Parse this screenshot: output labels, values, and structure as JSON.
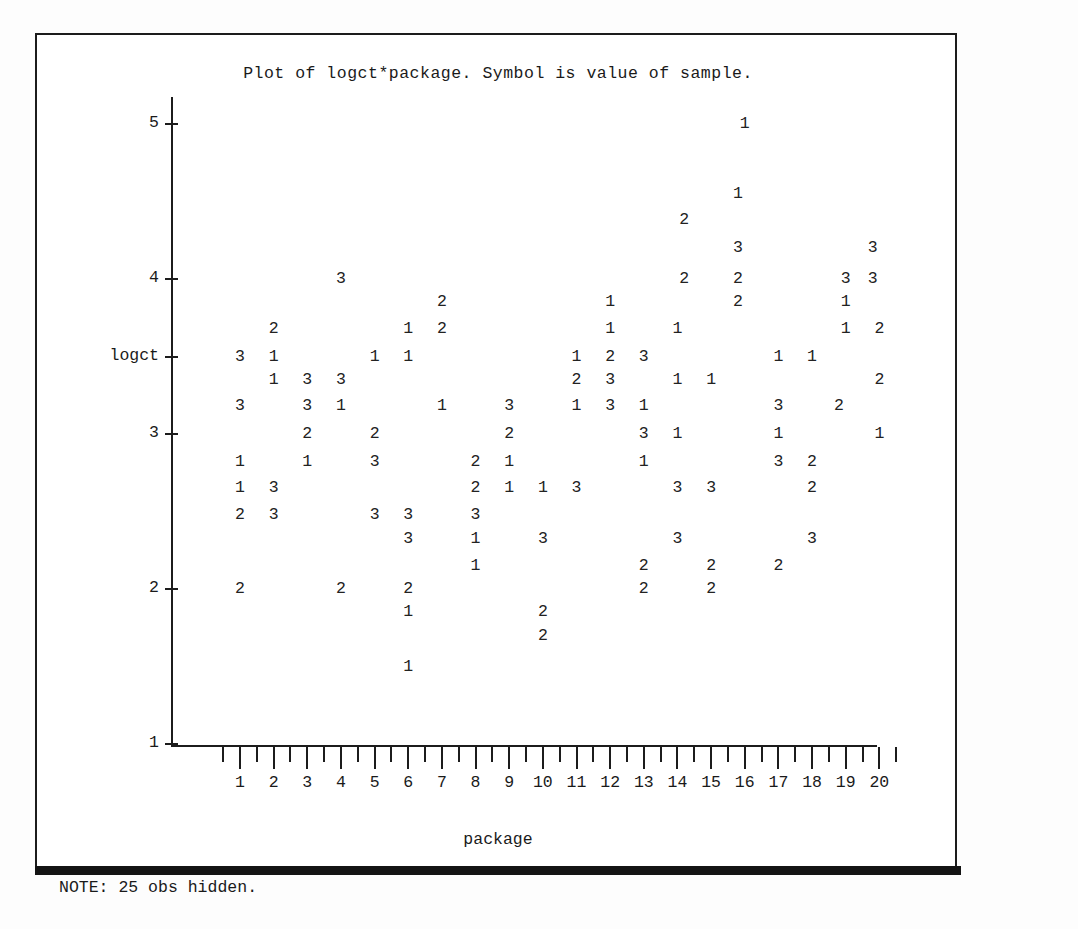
{
  "title": "Plot of logct*package. Symbol is value of sample.",
  "note": "NOTE: 25 obs hidden.",
  "axis": {
    "x_name": "package",
    "y_name": "logct"
  },
  "chart_data": {
    "type": "scatter",
    "title": "Plot of logct*package. Symbol is value of sample.",
    "xlabel": "package",
    "ylabel": "logct",
    "xlim": [
      0.5,
      20.5
    ],
    "ylim": [
      1,
      5.2
    ],
    "grid": false,
    "legend": null,
    "note": "NOTE: 25 obs hidden.",
    "symbol_meaning": "Symbol is value of sample (1, 2 or 3).",
    "x_ticks": [
      1,
      2,
      3,
      4,
      5,
      6,
      7,
      8,
      9,
      10,
      11,
      12,
      13,
      14,
      15,
      16,
      17,
      18,
      19,
      20
    ],
    "x_minor_ticks_per_interval": 1,
    "y_ticks": [
      5,
      4,
      3,
      2,
      1
    ],
    "y_axis_name_position": 3.5,
    "points": [
      {
        "package": 16.0,
        "logct": 5.0,
        "symbol": "1"
      },
      {
        "package": 15.8,
        "logct": 4.55,
        "symbol": "1"
      },
      {
        "package": 14.2,
        "logct": 4.38,
        "symbol": "2"
      },
      {
        "package": 15.8,
        "logct": 4.2,
        "symbol": "3"
      },
      {
        "package": 19.8,
        "logct": 4.2,
        "symbol": "3"
      },
      {
        "package": 4.0,
        "logct": 4.0,
        "symbol": "3"
      },
      {
        "package": 14.2,
        "logct": 4.0,
        "symbol": "2"
      },
      {
        "package": 15.8,
        "logct": 4.0,
        "symbol": "2"
      },
      {
        "package": 19.0,
        "logct": 4.0,
        "symbol": "3"
      },
      {
        "package": 19.8,
        "logct": 4.0,
        "symbol": "3"
      },
      {
        "package": 7.0,
        "logct": 3.85,
        "symbol": "2"
      },
      {
        "package": 12.0,
        "logct": 3.85,
        "symbol": "1"
      },
      {
        "package": 15.8,
        "logct": 3.85,
        "symbol": "2"
      },
      {
        "package": 19.0,
        "logct": 3.85,
        "symbol": "1"
      },
      {
        "package": 2.0,
        "logct": 3.68,
        "symbol": "2"
      },
      {
        "package": 6.0,
        "logct": 3.68,
        "symbol": "1"
      },
      {
        "package": 7.0,
        "logct": 3.68,
        "symbol": "2"
      },
      {
        "package": 12.0,
        "logct": 3.68,
        "symbol": "1"
      },
      {
        "package": 14.0,
        "logct": 3.68,
        "symbol": "1"
      },
      {
        "package": 19.0,
        "logct": 3.68,
        "symbol": "1"
      },
      {
        "package": 20.0,
        "logct": 3.68,
        "symbol": "2"
      },
      {
        "package": 1.0,
        "logct": 3.5,
        "symbol": "3"
      },
      {
        "package": 2.0,
        "logct": 3.5,
        "symbol": "1"
      },
      {
        "package": 5.0,
        "logct": 3.5,
        "symbol": "1"
      },
      {
        "package": 6.0,
        "logct": 3.5,
        "symbol": "1"
      },
      {
        "package": 11.0,
        "logct": 3.5,
        "symbol": "1"
      },
      {
        "package": 12.0,
        "logct": 3.5,
        "symbol": "2"
      },
      {
        "package": 13.0,
        "logct": 3.5,
        "symbol": "3"
      },
      {
        "package": 17.0,
        "logct": 3.5,
        "symbol": "1"
      },
      {
        "package": 18.0,
        "logct": 3.5,
        "symbol": "1"
      },
      {
        "package": 2.0,
        "logct": 3.35,
        "symbol": "1"
      },
      {
        "package": 3.0,
        "logct": 3.35,
        "symbol": "3"
      },
      {
        "package": 4.0,
        "logct": 3.35,
        "symbol": "3"
      },
      {
        "package": 11.0,
        "logct": 3.35,
        "symbol": "2"
      },
      {
        "package": 12.0,
        "logct": 3.35,
        "symbol": "3"
      },
      {
        "package": 14.0,
        "logct": 3.35,
        "symbol": "1"
      },
      {
        "package": 15.0,
        "logct": 3.35,
        "symbol": "1"
      },
      {
        "package": 20.0,
        "logct": 3.35,
        "symbol": "2"
      },
      {
        "package": 1.0,
        "logct": 3.18,
        "symbol": "3"
      },
      {
        "package": 3.0,
        "logct": 3.18,
        "symbol": "3"
      },
      {
        "package": 4.0,
        "logct": 3.18,
        "symbol": "1"
      },
      {
        "package": 7.0,
        "logct": 3.18,
        "symbol": "1"
      },
      {
        "package": 9.0,
        "logct": 3.18,
        "symbol": "3"
      },
      {
        "package": 11.0,
        "logct": 3.18,
        "symbol": "1"
      },
      {
        "package": 12.0,
        "logct": 3.18,
        "symbol": "3"
      },
      {
        "package": 13.0,
        "logct": 3.18,
        "symbol": "1"
      },
      {
        "package": 17.0,
        "logct": 3.18,
        "symbol": "3"
      },
      {
        "package": 18.8,
        "logct": 3.18,
        "symbol": "2"
      },
      {
        "package": 3.0,
        "logct": 3.0,
        "symbol": "2"
      },
      {
        "package": 5.0,
        "logct": 3.0,
        "symbol": "2"
      },
      {
        "package": 9.0,
        "logct": 3.0,
        "symbol": "2"
      },
      {
        "package": 13.0,
        "logct": 3.0,
        "symbol": "3"
      },
      {
        "package": 14.0,
        "logct": 3.0,
        "symbol": "1"
      },
      {
        "package": 17.0,
        "logct": 3.0,
        "symbol": "1"
      },
      {
        "package": 20.0,
        "logct": 3.0,
        "symbol": "1"
      },
      {
        "package": 1.0,
        "logct": 2.82,
        "symbol": "1"
      },
      {
        "package": 3.0,
        "logct": 2.82,
        "symbol": "1"
      },
      {
        "package": 5.0,
        "logct": 2.82,
        "symbol": "3"
      },
      {
        "package": 8.0,
        "logct": 2.82,
        "symbol": "2"
      },
      {
        "package": 9.0,
        "logct": 2.82,
        "symbol": "1"
      },
      {
        "package": 13.0,
        "logct": 2.82,
        "symbol": "1"
      },
      {
        "package": 17.0,
        "logct": 2.82,
        "symbol": "3"
      },
      {
        "package": 18.0,
        "logct": 2.82,
        "symbol": "2"
      },
      {
        "package": 1.0,
        "logct": 2.65,
        "symbol": "1"
      },
      {
        "package": 2.0,
        "logct": 2.65,
        "symbol": "3"
      },
      {
        "package": 8.0,
        "logct": 2.65,
        "symbol": "2"
      },
      {
        "package": 9.0,
        "logct": 2.65,
        "symbol": "1"
      },
      {
        "package": 10.0,
        "logct": 2.65,
        "symbol": "1"
      },
      {
        "package": 11.0,
        "logct": 2.65,
        "symbol": "3"
      },
      {
        "package": 14.0,
        "logct": 2.65,
        "symbol": "3"
      },
      {
        "package": 15.0,
        "logct": 2.65,
        "symbol": "3"
      },
      {
        "package": 18.0,
        "logct": 2.65,
        "symbol": "2"
      },
      {
        "package": 1.0,
        "logct": 2.48,
        "symbol": "2"
      },
      {
        "package": 2.0,
        "logct": 2.48,
        "symbol": "3"
      },
      {
        "package": 5.0,
        "logct": 2.48,
        "symbol": "3"
      },
      {
        "package": 6.0,
        "logct": 2.48,
        "symbol": "3"
      },
      {
        "package": 8.0,
        "logct": 2.48,
        "symbol": "3"
      },
      {
        "package": 6.0,
        "logct": 2.32,
        "symbol": "3"
      },
      {
        "package": 8.0,
        "logct": 2.32,
        "symbol": "1"
      },
      {
        "package": 10.0,
        "logct": 2.32,
        "symbol": "3"
      },
      {
        "package": 14.0,
        "logct": 2.32,
        "symbol": "3"
      },
      {
        "package": 18.0,
        "logct": 2.32,
        "symbol": "3"
      },
      {
        "package": 8.0,
        "logct": 2.15,
        "symbol": "1"
      },
      {
        "package": 13.0,
        "logct": 2.15,
        "symbol": "2"
      },
      {
        "package": 15.0,
        "logct": 2.15,
        "symbol": "2"
      },
      {
        "package": 17.0,
        "logct": 2.15,
        "symbol": "2"
      },
      {
        "package": 1.0,
        "logct": 2.0,
        "symbol": "2"
      },
      {
        "package": 4.0,
        "logct": 2.0,
        "symbol": "2"
      },
      {
        "package": 6.0,
        "logct": 2.0,
        "symbol": "2"
      },
      {
        "package": 13.0,
        "logct": 2.0,
        "symbol": "2"
      },
      {
        "package": 15.0,
        "logct": 2.0,
        "symbol": "2"
      },
      {
        "package": 6.0,
        "logct": 1.85,
        "symbol": "1"
      },
      {
        "package": 10.0,
        "logct": 1.85,
        "symbol": "2"
      },
      {
        "package": 10.0,
        "logct": 1.7,
        "symbol": "2"
      },
      {
        "package": 6.0,
        "logct": 1.5,
        "symbol": "1"
      }
    ]
  }
}
